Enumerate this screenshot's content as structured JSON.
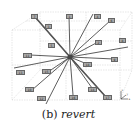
{
  "figure": {
    "caption_prefix": "(b)",
    "caption_word": "revert",
    "center": [
      70,
      57
    ],
    "labels": [
      {
        "text": "7",
        "x": 34,
        "y": 16
      },
      {
        "text": "1",
        "x": 69,
        "y": 16
      },
      {
        "text": "4",
        "x": 97,
        "y": 16
      },
      {
        "text": "6",
        "x": 111,
        "y": 20
      },
      {
        "text": "3",
        "x": 48,
        "y": 26
      },
      {
        "text": "5",
        "x": 51,
        "y": 45
      },
      {
        "text": "2",
        "x": 98,
        "y": 42
      },
      {
        "text": "8",
        "x": 122,
        "y": 40
      },
      {
        "text": "11",
        "x": 27,
        "y": 55
      },
      {
        "text": "9",
        "x": 114,
        "y": 59
      },
      {
        "text": "18",
        "x": 87,
        "y": 64
      },
      {
        "text": "13",
        "x": 20,
        "y": 72
      },
      {
        "text": "15",
        "x": 46,
        "y": 71
      },
      {
        "text": "10",
        "x": 29,
        "y": 89
      },
      {
        "text": "12",
        "x": 41,
        "y": 98
      },
      {
        "text": "16",
        "x": 73,
        "y": 97
      },
      {
        "text": "14",
        "x": 92,
        "y": 89
      },
      {
        "text": "17",
        "x": 107,
        "y": 97
      }
    ],
    "axes_labels": {
      "z": "z",
      "y": "y",
      "x": "x"
    }
  }
}
